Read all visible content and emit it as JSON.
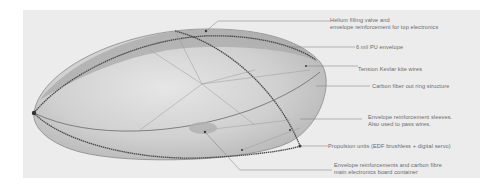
{
  "diagram": {
    "labels": [
      {
        "id": "helium-valve",
        "lines": [
          "Helium filling valve and",
          "envelope reinforcement for top electronics"
        ]
      },
      {
        "id": "pu-envelope",
        "lines": [
          "6 mil PU envelope"
        ]
      },
      {
        "id": "kevlar-wires",
        "lines": [
          "Tension Kevlar kite wires"
        ]
      },
      {
        "id": "carbon-ring",
        "lines": [
          "Carbon fiber out ring structure"
        ]
      },
      {
        "id": "reinforcement-sleeves",
        "lines": [
          "Envelope reinforcement sleeves.",
          "Also used to pass wires."
        ]
      },
      {
        "id": "propulsion-units",
        "lines": [
          "Propulsion units (EDF brushless + digital servo)"
        ]
      },
      {
        "id": "electronics-container",
        "lines": [
          "Envelope reinforcements and carbon fibre",
          "main electronics board container"
        ]
      }
    ],
    "colors": {
      "background": "#ffffff",
      "panel": "#ececec",
      "envelope_fill": "#c8c8c8",
      "envelope_top_band": "#a9a9a9",
      "ring_stroke": "#4a4a4a",
      "leader_line": "#7a7a7a",
      "label_text": "#6a6a6a"
    }
  }
}
